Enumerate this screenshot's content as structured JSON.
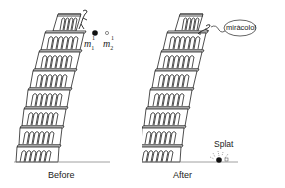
{
  "figure": {
    "panels": [
      {
        "id": "before",
        "caption": "Before",
        "masses": [
          {
            "label": "m",
            "superscript": "1",
            "subscript": "1",
            "fill": "#111111"
          },
          {
            "label": "m",
            "superscript": "1",
            "subscript": "2",
            "fill": "#ffffff"
          }
        ]
      },
      {
        "id": "after",
        "caption": "After",
        "speech_bubble": "miràcolo!",
        "impact_label": "Splat"
      }
    ],
    "colors": {
      "line": "#222222",
      "ground": "#888888",
      "background": "#ffffff"
    }
  }
}
